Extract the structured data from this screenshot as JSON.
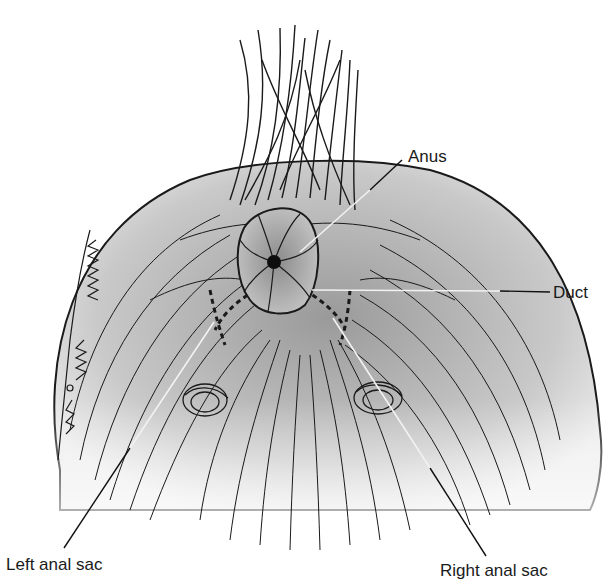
{
  "figure": {
    "signature": "Scribbled artist signature (vertical, left edge)",
    "colors": {
      "background": "#ffffff",
      "hair_stroke": "#1a1a1a",
      "skin_fill": "#bdbdbd",
      "anus_fill": "#a8a8a8",
      "leader_line_dark": "#111111",
      "leader_line_light": "#f2f2f2",
      "label_text": "#1a1a1a"
    }
  },
  "labels": {
    "anus": "Anus",
    "duct": "Duct",
    "left_anal_sac": "Left anal sac",
    "right_anal_sac": "Right anal sac"
  },
  "leaders": [
    {
      "name": "anus",
      "from": [
        402,
        160
      ],
      "to": [
        300,
        252
      ]
    },
    {
      "name": "duct",
      "from": [
        550,
        292
      ],
      "to": [
        312,
        290
      ]
    },
    {
      "name": "left-anal-sac",
      "from": [
        64,
        548
      ],
      "to": [
        214,
        322
      ]
    },
    {
      "name": "right-anal-sac",
      "from": [
        486,
        556
      ],
      "to": [
        333,
        318
      ]
    }
  ]
}
